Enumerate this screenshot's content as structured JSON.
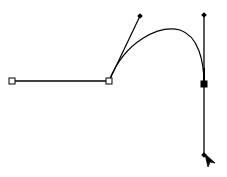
{
  "canvas": {
    "width": 227,
    "height": 177,
    "background": "#ffffff",
    "stroke": "#000000"
  },
  "path": {
    "anchors": [
      {
        "name": "anchor-start",
        "x": 12,
        "y": 81,
        "type": "hollow"
      },
      {
        "name": "anchor-middle",
        "x": 109,
        "y": 81,
        "type": "hollow"
      },
      {
        "name": "anchor-end",
        "x": 204,
        "y": 84,
        "type": "filled"
      }
    ],
    "handles": [
      {
        "name": "handle-middle-out",
        "x": 140,
        "y": 16
      },
      {
        "name": "handle-end-in",
        "x": 204,
        "y": 15
      },
      {
        "name": "handle-end-out",
        "x": 204,
        "y": 155
      }
    ]
  },
  "cursor": {
    "icon": "direct-selection-arrow-icon",
    "x": 205,
    "y": 154
  }
}
